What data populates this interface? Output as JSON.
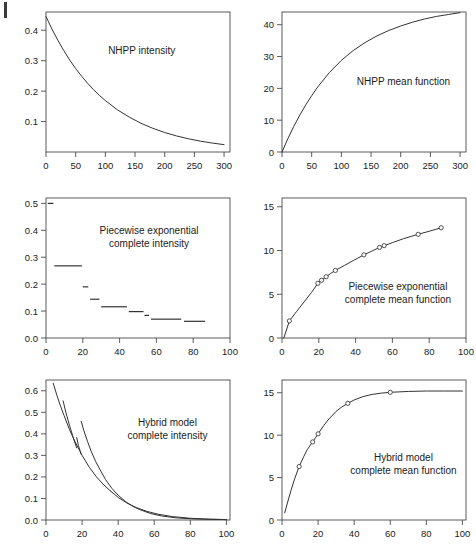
{
  "figure": {
    "layout": "2 columns x 3 rows of line plots",
    "background": "#ffffff",
    "ink_color": "#333333",
    "margin_mark": "page-edge-bar"
  },
  "chart_data": [
    {
      "id": "nhpp-intensity",
      "type": "line",
      "title": "",
      "annotation": "NHPP intensity",
      "annotation_lines": [
        "NHPP intensity"
      ],
      "xlabel": "",
      "ylabel": "",
      "xlim": [
        0,
        310
      ],
      "ylim": [
        0.0,
        0.46
      ],
      "grid": false,
      "xticks": [
        0,
        50,
        100,
        150,
        200,
        250,
        300
      ],
      "xticklabels": [
        "0",
        "50",
        "100",
        "150",
        "200",
        "250",
        "300"
      ],
      "yticks": [
        0.1,
        0.2,
        0.3,
        0.4
      ],
      "yticklabels": [
        "0.1",
        "0.2",
        "0.3",
        "0.4"
      ],
      "model": "lambda(t) = 0.445 * exp(-0.0097 t)",
      "x": [
        0,
        10,
        20,
        30,
        40,
        50,
        60,
        70,
        80,
        90,
        100,
        120,
        140,
        160,
        180,
        200,
        220,
        240,
        260,
        280,
        300
      ],
      "y": [
        0.445,
        0.404,
        0.367,
        0.333,
        0.302,
        0.274,
        0.249,
        0.226,
        0.205,
        0.186,
        0.169,
        0.139,
        0.115,
        0.0945,
        0.0778,
        0.064,
        0.0527,
        0.0434,
        0.0357,
        0.0294,
        0.0242
      ]
    },
    {
      "id": "nhpp-mean-function",
      "type": "line",
      "title": "",
      "annotation": "NHPP mean function",
      "annotation_lines": [
        "NHPP mean function"
      ],
      "xlabel": "",
      "ylabel": "",
      "xlim": [
        0,
        310
      ],
      "ylim": [
        0,
        44
      ],
      "grid": false,
      "xticks": [
        0,
        50,
        100,
        150,
        200,
        250,
        300
      ],
      "xticklabels": [
        "0",
        "50",
        "100",
        "150",
        "200",
        "250",
        "300"
      ],
      "yticks": [
        0,
        10,
        20,
        30,
        40
      ],
      "yticklabels": [
        "0",
        "10",
        "20",
        "30",
        "40"
      ],
      "model": "m(t) = 45.9 * (1 - exp(-0.0097 t))",
      "x": [
        0,
        10,
        20,
        30,
        40,
        50,
        60,
        80,
        100,
        120,
        140,
        160,
        180,
        200,
        220,
        240,
        260,
        280,
        300
      ],
      "y": [
        0.0,
        4.25,
        8.1,
        11.6,
        14.8,
        17.7,
        20.4,
        25.0,
        28.8,
        31.9,
        34.4,
        36.5,
        38.2,
        39.6,
        40.8,
        41.8,
        42.6,
        43.2,
        43.8
      ]
    },
    {
      "id": "piecewise-exponential-complete-intensity",
      "type": "step",
      "title": "",
      "annotation": "Piecewise exponential complete intensity",
      "annotation_lines": [
        "Piecewise exponential",
        "complete intensity"
      ],
      "xlabel": "",
      "ylabel": "",
      "xlim": [
        0,
        100
      ],
      "ylim": [
        0.0,
        0.52
      ],
      "grid": false,
      "xticks": [
        0,
        20,
        40,
        60,
        80,
        100
      ],
      "xticklabels": [
        "0",
        "20",
        "40",
        "60",
        "80",
        "100"
      ],
      "yticks": [
        0.0,
        0.1,
        0.2,
        0.3,
        0.4,
        0.5
      ],
      "yticklabels": [
        "0.0",
        "0.1",
        "0.2",
        "0.3",
        "0.4",
        "0.5"
      ],
      "segments": [
        {
          "x0": 1.0,
          "x1": 4.0,
          "y": 0.5
        },
        {
          "x0": 4.5,
          "x1": 19.5,
          "y": 0.268
        },
        {
          "x0": 20.0,
          "x1": 23.0,
          "y": 0.19
        },
        {
          "x0": 24.0,
          "x1": 29.0,
          "y": 0.144
        },
        {
          "x0": 30.0,
          "x1": 44.0,
          "y": 0.116
        },
        {
          "x0": 45.0,
          "x1": 53.0,
          "y": 0.098
        },
        {
          "x0": 53.5,
          "x1": 56.0,
          "y": 0.084
        },
        {
          "x0": 57.0,
          "x1": 73.5,
          "y": 0.07
        },
        {
          "x0": 75.0,
          "x1": 86.5,
          "y": 0.062
        }
      ]
    },
    {
      "id": "piecewise-exponential-complete-mean-function",
      "type": "line",
      "title": "",
      "annotation": "Piecewise exponential complete mean function",
      "annotation_lines": [
        "Piecewise exponential",
        "complete mean function"
      ],
      "xlabel": "",
      "ylabel": "",
      "xlim": [
        0,
        100
      ],
      "ylim": [
        0,
        16
      ],
      "grid": false,
      "xticks": [
        0,
        20,
        40,
        60,
        80,
        100
      ],
      "xticklabels": [
        "0",
        "20",
        "40",
        "60",
        "80",
        "100"
      ],
      "yticks": [
        0,
        5,
        10,
        15
      ],
      "yticklabels": [
        "0",
        "5",
        "10",
        "15"
      ],
      "x": [
        1.0,
        4.0,
        8.0,
        12.0,
        16.0,
        19.5,
        21.5,
        24.0,
        26.5,
        29.0,
        34.0,
        39.0,
        44.5,
        49.0,
        53.0,
        55.5,
        60.0,
        66.0,
        74.0,
        80.0,
        86.5
      ],
      "y": [
        0.0,
        1.95,
        3.05,
        4.12,
        5.2,
        6.25,
        6.6,
        7.0,
        7.38,
        7.72,
        8.3,
        8.88,
        9.5,
        9.95,
        10.35,
        10.55,
        10.9,
        11.35,
        11.85,
        12.2,
        12.6
      ],
      "points": {
        "marker": "open-circle",
        "x": [
          4.0,
          19.5,
          21.5,
          24.0,
          29.0,
          44.5,
          53.0,
          55.5,
          74.0,
          86.5
        ],
        "y": [
          1.95,
          6.25,
          6.6,
          7.0,
          7.72,
          9.5,
          10.35,
          10.55,
          11.85,
          12.6
        ]
      }
    },
    {
      "id": "hybrid-model-complete-intensity",
      "type": "line",
      "title": "",
      "annotation": "Hybrid model complete intensity",
      "annotation_lines": [
        "Hybrid model",
        "complete intensity"
      ],
      "xlabel": "",
      "ylabel": "",
      "xlim": [
        0,
        102
      ],
      "ylim": [
        0.0,
        0.65
      ],
      "grid": false,
      "xticks": [
        0,
        20,
        40,
        60,
        80,
        100
      ],
      "xticklabels": [
        "0",
        "20",
        "40",
        "60",
        "80",
        "100"
      ],
      "yticks": [
        0.0,
        0.1,
        0.2,
        0.3,
        0.4,
        0.5,
        0.6
      ],
      "yticklabels": [
        "0.0",
        "0.1",
        "0.2",
        "0.3",
        "0.4",
        "0.5",
        "0.6"
      ],
      "branches": [
        {
          "name": "main-branch",
          "x": [
            4.0,
            6,
            8,
            10,
            13,
            16,
            20,
            24,
            28,
            32,
            36
          ],
          "y": [
            0.635,
            0.58,
            0.53,
            0.485,
            0.42,
            0.365,
            0.3,
            0.245,
            0.2,
            0.163,
            0.133
          ]
        },
        {
          "name": "restart-1",
          "x": [
            9.5,
            11,
            13,
            15,
            17
          ],
          "y": [
            0.553,
            0.5,
            0.44,
            0.385,
            0.335
          ]
        },
        {
          "name": "restart-1b",
          "x": [
            17.0,
            18,
            19.5
          ],
          "y": [
            0.383,
            0.345,
            0.305
          ]
        },
        {
          "name": "restart-2",
          "x": [
            19.5,
            21,
            23,
            25,
            27.5,
            30,
            33,
            36.5,
            40,
            44,
            48,
            52,
            58,
            64,
            72,
            82,
            92,
            100
          ],
          "y": [
            0.458,
            0.415,
            0.365,
            0.32,
            0.272,
            0.233,
            0.188,
            0.147,
            0.115,
            0.086,
            0.064,
            0.048,
            0.03,
            0.019,
            0.01,
            0.005,
            0.003,
            0.002
          ]
        },
        {
          "name": "tail-branch",
          "x": [
            36.0,
            40,
            45,
            50,
            56,
            62,
            70,
            80,
            90,
            100
          ],
          "y": [
            0.133,
            0.105,
            0.078,
            0.058,
            0.04,
            0.027,
            0.016,
            0.008,
            0.004,
            0.002
          ]
        }
      ]
    },
    {
      "id": "hybrid-model-complete-mean-function",
      "type": "line",
      "title": "",
      "annotation": "Hybrid model complete mean function",
      "annotation_lines": [
        "Hybrid model",
        "complete mean function"
      ],
      "xlabel": "",
      "ylabel": "",
      "xlim": [
        0,
        102
      ],
      "ylim": [
        0,
        16.5
      ],
      "grid": false,
      "xticks": [
        0,
        20,
        40,
        60,
        80,
        100
      ],
      "xticklabels": [
        "0",
        "20",
        "40",
        "60",
        "80",
        "100"
      ],
      "yticks": [
        0,
        5,
        10,
        15
      ],
      "yticklabels": [
        "0",
        "5",
        "10",
        "15"
      ],
      "x": [
        1.5,
        3,
        5,
        7,
        9.5,
        12,
        14,
        17,
        20,
        23,
        26,
        30,
        33,
        36.5,
        40,
        45,
        50,
        55,
        60,
        70,
        80,
        90,
        100
      ],
      "y": [
        0.85,
        2.0,
        3.5,
        4.85,
        6.3,
        7.45,
        8.3,
        9.2,
        10.15,
        11.1,
        11.9,
        12.8,
        13.3,
        13.75,
        14.15,
        14.55,
        14.8,
        14.95,
        15.05,
        15.15,
        15.2,
        15.2,
        15.2
      ],
      "points": {
        "marker": "open-circle",
        "x": [
          9.5,
          17,
          20,
          36.5,
          60
        ],
        "y": [
          6.3,
          9.2,
          10.15,
          13.75,
          15.05
        ]
      }
    }
  ]
}
